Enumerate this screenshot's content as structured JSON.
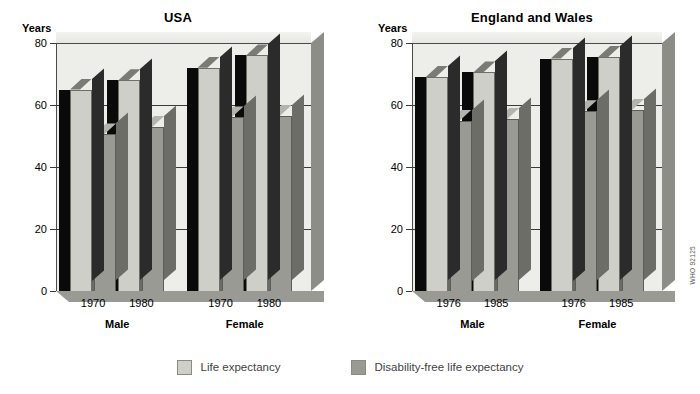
{
  "figure": {
    "watermark": "WHO 92125"
  },
  "legend": {
    "position": "bottom-center",
    "items": [
      {
        "label": "Life expectancy",
        "color": "#cfcfca",
        "key": "life-expectancy"
      },
      {
        "label": "Disability-free life expectancy",
        "color": "#9a9a95",
        "key": "disability-free-life-expectancy"
      }
    ]
  },
  "chart_data": [
    {
      "type": "bar",
      "title": "USA",
      "xlabel": "",
      "ylabel": "Years",
      "ylim": [
        0,
        80
      ],
      "yticks": [
        0,
        20,
        40,
        60,
        80
      ],
      "grid": true,
      "categories": [
        "1970",
        "1980",
        "1970",
        "1980"
      ],
      "groups": [
        {
          "label": "Male",
          "categories": [
            "1970",
            "1980"
          ]
        },
        {
          "label": "Female",
          "categories": [
            "1970",
            "1980"
          ]
        }
      ],
      "series": [
        {
          "name": "Life expectancy",
          "values": [
            65,
            68,
            72,
            76
          ]
        },
        {
          "name": "Disability-free life expectancy",
          "values": [
            50.5,
            53,
            56,
            56.5
          ]
        }
      ]
    },
    {
      "type": "bar",
      "title": "England and Wales",
      "xlabel": "",
      "ylabel": "Years",
      "ylim": [
        0,
        80
      ],
      "yticks": [
        0,
        20,
        40,
        60,
        80
      ],
      "grid": true,
      "categories": [
        "1976",
        "1985",
        "1976",
        "1985"
      ],
      "groups": [
        {
          "label": "Male",
          "categories": [
            "1976",
            "1985"
          ]
        },
        {
          "label": "Female",
          "categories": [
            "1976",
            "1985"
          ]
        }
      ],
      "series": [
        {
          "name": "Life expectancy",
          "values": [
            69,
            70.5,
            75,
            75.5
          ]
        },
        {
          "name": "Disability-free life expectancy",
          "values": [
            55,
            55.5,
            58,
            58.5
          ]
        }
      ]
    }
  ]
}
